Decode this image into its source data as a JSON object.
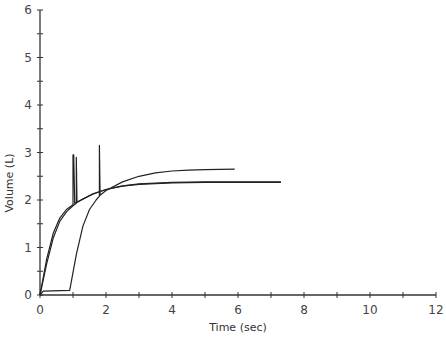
{
  "chart_data": {
    "type": "line",
    "title": "",
    "xlabel": "Time (sec)",
    "ylabel": "Volume (L)",
    "xlim": [
      0,
      12
    ],
    "ylim": [
      0,
      6
    ],
    "x_ticks": [
      0,
      2,
      4,
      6,
      8,
      10,
      12
    ],
    "y_ticks": [
      0,
      1,
      2,
      3,
      4,
      5,
      6
    ],
    "x_minor_step": 1,
    "y_minor_step": 0.5,
    "grid": false,
    "legend": null,
    "series": [
      {
        "name": "Trial A",
        "x": [
          0,
          0.2,
          0.4,
          0.6,
          0.8,
          1.0,
          1.0,
          1.02,
          1.05,
          1.3,
          1.6,
          2.0,
          2.5,
          3.0,
          4.0,
          5.0,
          6.0,
          7.3
        ],
        "y": [
          0,
          0.75,
          1.3,
          1.62,
          1.8,
          1.9,
          2.95,
          2.95,
          1.93,
          2.02,
          2.12,
          2.22,
          2.3,
          2.34,
          2.37,
          2.38,
          2.38,
          2.38
        ]
      },
      {
        "name": "Trial B",
        "x": [
          0,
          0.2,
          0.4,
          0.6,
          0.8,
          1.0,
          1.1,
          1.1,
          1.12,
          1.3,
          1.6,
          2.0,
          2.5,
          3.0,
          4.0,
          5.0,
          6.0,
          7.3
        ],
        "y": [
          0,
          0.65,
          1.2,
          1.55,
          1.75,
          1.88,
          1.93,
          2.9,
          1.95,
          2.02,
          2.13,
          2.22,
          2.29,
          2.33,
          2.36,
          2.37,
          2.37,
          2.37
        ]
      },
      {
        "name": "Trial C",
        "x": [
          0,
          0.1,
          0.9,
          1.1,
          1.3,
          1.5,
          1.7,
          1.8,
          1.8,
          1.82,
          2.0,
          2.5,
          3.0,
          3.5,
          4.0,
          4.5,
          5.0,
          5.9
        ],
        "y": [
          0,
          0.08,
          0.1,
          0.85,
          1.45,
          1.8,
          2.0,
          2.08,
          3.15,
          2.1,
          2.2,
          2.38,
          2.5,
          2.57,
          2.61,
          2.63,
          2.64,
          2.65
        ]
      }
    ],
    "annotations": []
  },
  "style": {
    "line_color": "#222222",
    "axis_color": "#333333",
    "label_color": "#444444"
  }
}
